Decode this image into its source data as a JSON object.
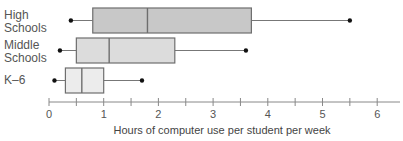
{
  "chart_data": {
    "type": "boxplot",
    "title": "",
    "xlabel": "Hours of computer use per student per week",
    "ylabel": "",
    "xlim": [
      0,
      6.4
    ],
    "xticks": [
      0,
      1,
      2,
      3,
      4,
      5,
      6
    ],
    "minor_ticks": [
      0.5,
      1.5,
      2.5,
      3.5,
      4.5,
      5.5
    ],
    "grid": false,
    "legend": null,
    "categories": [
      "High Schools",
      "Middle Schools",
      "K–6"
    ],
    "series": [
      {
        "name": "High Schools",
        "min": 0.4,
        "q1": 0.8,
        "median": 1.8,
        "q3": 3.7,
        "max": 5.5,
        "fill": "#c8c8c8"
      },
      {
        "name": "Middle Schools",
        "min": 0.2,
        "q1": 0.5,
        "median": 1.1,
        "q3": 2.3,
        "max": 3.6,
        "fill": "#dcdcdc"
      },
      {
        "name": "K–6",
        "min": 0.1,
        "q1": 0.3,
        "median": 0.6,
        "q3": 1.0,
        "max": 1.7,
        "fill": "#ececec"
      }
    ]
  },
  "labels": {
    "high_line1": "High",
    "high_line2": "Schools",
    "middle_line1": "Middle",
    "middle_line2": "Schools",
    "k6": "K–6"
  },
  "axis": {
    "tick_labels": [
      "0",
      "1",
      "2",
      "3",
      "4",
      "5",
      "6"
    ],
    "xlabel": "Hours of computer use per student per week"
  },
  "colors": {
    "box_stroke": "#6e6e6e",
    "whisker": "#777777",
    "dot": "#111111",
    "axis": "#888888"
  }
}
